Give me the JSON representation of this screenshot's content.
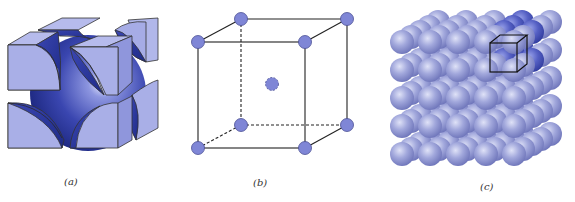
{
  "figure": {
    "panels": [
      {
        "id": "a",
        "label": "(a)",
        "description": "hard-sphere unit cell"
      },
      {
        "id": "b",
        "label": "(b)",
        "description": "reduced-sphere unit cell"
      },
      {
        "id": "c",
        "label": "(c)",
        "description": "aggregate of many atoms"
      }
    ],
    "colors": {
      "atom_fill": "#7f86d6",
      "atom_face_light": "#aab0e6",
      "atom_dark": "#2e3a9a",
      "edge": "#222222",
      "aggregate_sphere": "#9aa0d8"
    }
  }
}
